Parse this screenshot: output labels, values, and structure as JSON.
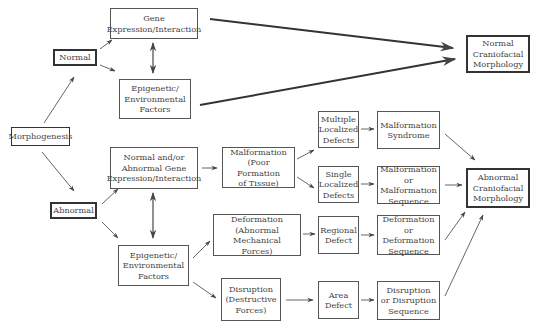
{
  "diagram": {
    "type": "flowchart",
    "topic": "Morphogenesis pathways to craniofacial morphology",
    "nodes": {
      "morphogenesis": "Morphogenesis",
      "normal": "Normal",
      "abnormal": "Abnormal",
      "gene_expression_normal": "Gene\nExpression/Interaction",
      "epigenetic_normal": "Epigenetic/\nEnvironmental\nFactors",
      "normal_craniofacial": "Normal\nCraniofacial\nMorphology",
      "gene_expression_abnormal": "Normal and/or\nAbnormal Gene\nExpression/Interaction",
      "epigenetic_abnormal": "Epigenetic/\nEnvironmental\nFactors",
      "malformation": "Malformation\n(Poor Formation\nof Tissue)",
      "deformation": "Deformation\n(Abnormal Mechanical\nForces)",
      "disruption": "Disruption\n(Destructive\nForces)",
      "multiple_localized_defects": "Multiple\nLocalized\nDefects",
      "single_localized_defects": "Single\nLocalized\nDefects",
      "regional_defect": "Regional\nDefect",
      "area_defect": "Area\nDefect",
      "malformation_syndrome": "Malformation\nSyndrome",
      "malformation_sequence": "Malformation\nor Malformation\nSequence",
      "deformation_sequence": "Deformation\nor Deformation\nSequence",
      "disruption_sequence": "Disruption\nor Disruption\nSequence",
      "abnormal_craniofacial": "Abnormal\nCraniofacial\nMorphology"
    },
    "edges": [
      {
        "from": "morphogenesis",
        "to": "normal"
      },
      {
        "from": "morphogenesis",
        "to": "abnormal"
      },
      {
        "from": "normal",
        "to": "gene_expression_normal"
      },
      {
        "from": "normal",
        "to": "epigenetic_normal"
      },
      {
        "from": "gene_expression_normal",
        "to": "epigenetic_normal",
        "bidirectional": true
      },
      {
        "from": "gene_expression_normal",
        "to": "normal_craniofacial"
      },
      {
        "from": "epigenetic_normal",
        "to": "normal_craniofacial"
      },
      {
        "from": "abnormal",
        "to": "gene_expression_abnormal"
      },
      {
        "from": "abnormal",
        "to": "epigenetic_abnormal"
      },
      {
        "from": "gene_expression_abnormal",
        "to": "epigenetic_abnormal",
        "bidirectional": true
      },
      {
        "from": "gene_expression_abnormal",
        "to": "malformation"
      },
      {
        "from": "epigenetic_abnormal",
        "to": "deformation"
      },
      {
        "from": "epigenetic_abnormal",
        "to": "disruption"
      },
      {
        "from": "malformation",
        "to": "multiple_localized_defects"
      },
      {
        "from": "malformation",
        "to": "single_localized_defects"
      },
      {
        "from": "deformation",
        "to": "regional_defect"
      },
      {
        "from": "disruption",
        "to": "area_defect"
      },
      {
        "from": "multiple_localized_defects",
        "to": "malformation_syndrome"
      },
      {
        "from": "single_localized_defects",
        "to": "malformation_sequence"
      },
      {
        "from": "regional_defect",
        "to": "deformation_sequence"
      },
      {
        "from": "area_defect",
        "to": "disruption_sequence"
      },
      {
        "from": "malformation_syndrome",
        "to": "abnormal_craniofacial"
      },
      {
        "from": "malformation_sequence",
        "to": "abnormal_craniofacial"
      },
      {
        "from": "deformation_sequence",
        "to": "abnormal_craniofacial"
      },
      {
        "from": "disruption_sequence",
        "to": "abnormal_craniofacial"
      }
    ]
  }
}
